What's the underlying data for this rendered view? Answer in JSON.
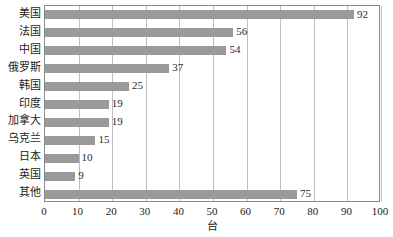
{
  "chart_data": {
    "type": "bar",
    "orientation": "horizontal",
    "title": "",
    "subtitle": "",
    "xlabel": "台",
    "ylabel": "",
    "xlim": [
      0,
      100
    ],
    "grid": true,
    "legend": false,
    "legend_position": "none",
    "bar_color": "#9a9a9a",
    "gridline_color": "#bfbfbf",
    "axis_color": "#8a8a8a",
    "text_color": "#1c1c1c",
    "xticks": [
      0,
      10,
      20,
      30,
      40,
      50,
      60,
      70,
      80,
      90,
      100
    ],
    "xtick_labels": [
      "0",
      "10",
      "20",
      "30",
      "40",
      "50",
      "60",
      "70",
      "80",
      "90",
      "100"
    ],
    "categories": [
      "美国",
      "法国",
      "中国",
      "俄罗斯",
      "韩国",
      "印度",
      "加拿大",
      "乌克兰",
      "日本",
      "英国",
      "其他"
    ],
    "values": [
      92,
      56,
      54,
      37,
      25,
      19,
      19,
      15,
      10,
      9,
      75
    ],
    "value_labels": [
      "92",
      "56",
      "54",
      "37",
      "25",
      "19",
      "19",
      "15",
      "10",
      "9",
      "75"
    ]
  }
}
